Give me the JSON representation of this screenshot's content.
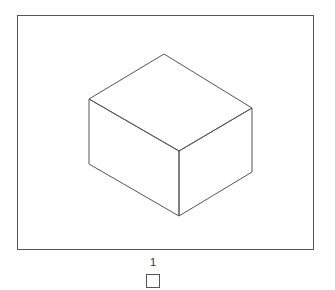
{
  "figure": {
    "label": "1",
    "shape": "isometric-cube",
    "stroke_color": "#555555"
  }
}
